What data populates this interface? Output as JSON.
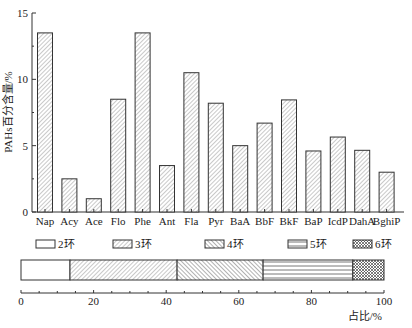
{
  "chart_data": [
    {
      "type": "bar",
      "title": "",
      "xlabel": "",
      "ylabel": "PAHs百分含量/%",
      "ylim": [
        0,
        15
      ],
      "yticks": [
        0,
        5,
        10,
        15
      ],
      "grid": false,
      "categories": [
        "Nap",
        "Acy",
        "Ace",
        "Flo",
        "Phe",
        "Ant",
        "Fla",
        "Pyr",
        "BaA",
        "BbF",
        "BkF",
        "BaP",
        "IcdP",
        "DahA",
        "BghiP"
      ],
      "values": [
        13.5,
        2.5,
        1.0,
        8.5,
        13.5,
        3.5,
        10.5,
        8.2,
        5.0,
        6.7,
        8.45,
        4.6,
        5.65,
        4.65,
        3.0
      ],
      "bar_style": "diagonal-hatch"
    },
    {
      "type": "bar",
      "orientation": "horizontal-stacked",
      "title": "",
      "xlabel": "占比/%",
      "xlim": [
        0,
        100
      ],
      "xticks": [
        0,
        20,
        40,
        60,
        80,
        100
      ],
      "legend_position": "top",
      "series": [
        {
          "name": "2环",
          "value": 13.5,
          "pattern": "empty"
        },
        {
          "name": "3环",
          "value": 29.5,
          "pattern": "hatch-forward"
        },
        {
          "name": "4环",
          "value": 23.7,
          "pattern": "hatch-backward"
        },
        {
          "name": "5环",
          "value": 24.7,
          "pattern": "horizontal-lines"
        },
        {
          "name": "6环",
          "value": 8.6,
          "pattern": "crosshatch"
        }
      ]
    }
  ],
  "labels": {
    "ylabel": "PAHs百分含量/%",
    "xlabel2": "占比/%"
  }
}
